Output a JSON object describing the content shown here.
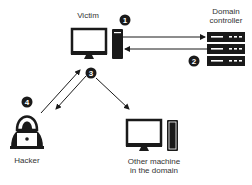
{
  "diagram": {
    "nodes": {
      "victim": {
        "label": "Victim"
      },
      "domain_controller": {
        "label_line1": "Domain",
        "label_line2": "controller"
      },
      "hacker": {
        "label": "Hacker"
      },
      "other_machine": {
        "label_line1": "Other machine",
        "label_line2": "in the domain"
      }
    },
    "steps": [
      {
        "number": "1"
      },
      {
        "number": "2"
      },
      {
        "number": "3"
      },
      {
        "number": "4"
      }
    ],
    "colors": {
      "ink": "#1a1a1a",
      "background": "#ffffff"
    }
  }
}
